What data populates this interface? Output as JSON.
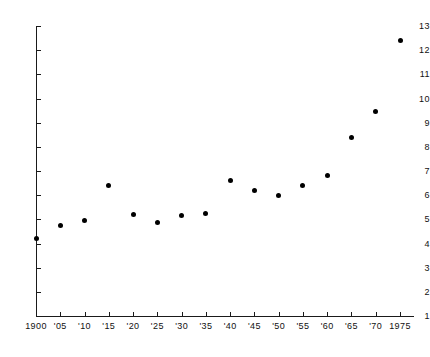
{
  "chart_data": {
    "type": "scatter",
    "title": "",
    "subtitle": "",
    "xlabel": "",
    "ylabel": "",
    "xlim": [
      1900,
      1975
    ],
    "ylim": [
      1,
      13
    ],
    "grid": false,
    "legend": null,
    "x_tick_labels": [
      "1900",
      "'05",
      "'10",
      "'15",
      "'20",
      "'25",
      "'30",
      "'35",
      "'40",
      "'45",
      "'50",
      "'55",
      "'60",
      "'65",
      "'70",
      "1975"
    ],
    "x_tick_values": [
      1900,
      1905,
      1910,
      1915,
      1920,
      1925,
      1930,
      1935,
      1940,
      1945,
      1950,
      1955,
      1960,
      1965,
      1970,
      1975
    ],
    "y_tick_labels": [
      "1",
      "2",
      "3",
      "4",
      "5",
      "6",
      "7",
      "8",
      "9",
      "10",
      "11",
      "12",
      "13"
    ],
    "y_tick_values": [
      1,
      2,
      3,
      4,
      5,
      6,
      7,
      8,
      9,
      10,
      11,
      12,
      13
    ],
    "marker_color": "#000000",
    "axis_color": "#1a1a1a",
    "background_color": "#ffffff",
    "x": [
      1900,
      1905,
      1910,
      1915,
      1920,
      1925,
      1930,
      1935,
      1940,
      1945,
      1950,
      1955,
      1960,
      1965,
      1970,
      1975
    ],
    "values": [
      4.2,
      4.75,
      4.95,
      6.4,
      5.2,
      4.85,
      5.15,
      5.25,
      6.6,
      6.2,
      6.0,
      6.4,
      6.8,
      8.4,
      9.45,
      12.4
    ],
    "points": [
      {
        "x": 1900,
        "y": 4.2
      },
      {
        "x": 1905,
        "y": 4.75
      },
      {
        "x": 1910,
        "y": 4.95
      },
      {
        "x": 1915,
        "y": 6.4
      },
      {
        "x": 1920,
        "y": 5.2
      },
      {
        "x": 1925,
        "y": 4.85
      },
      {
        "x": 1930,
        "y": 5.15
      },
      {
        "x": 1935,
        "y": 5.25
      },
      {
        "x": 1940,
        "y": 6.6
      },
      {
        "x": 1945,
        "y": 6.2
      },
      {
        "x": 1950,
        "y": 6.0
      },
      {
        "x": 1955,
        "y": 6.4
      },
      {
        "x": 1960,
        "y": 6.8
      },
      {
        "x": 1965,
        "y": 8.4
      },
      {
        "x": 1970,
        "y": 9.45
      },
      {
        "x": 1975,
        "y": 12.4
      }
    ]
  }
}
